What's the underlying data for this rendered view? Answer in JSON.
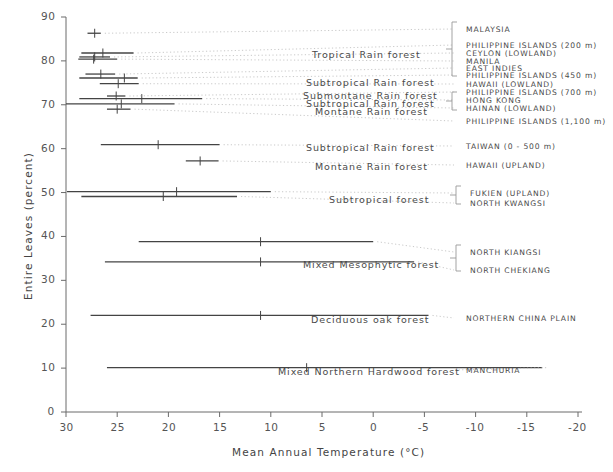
{
  "chart_data": {
    "type": "scatter",
    "title": "",
    "xlabel": "Mean Annual Temperature (°C)",
    "ylabel": "Entire Leaves (percent)",
    "xlim": [
      30,
      -20
    ],
    "ylim": [
      0,
      90
    ],
    "xticks": [
      30,
      25,
      20,
      15,
      10,
      5,
      0,
      -5,
      -10,
      -15,
      -20
    ],
    "xtick_labels": [
      "30",
      "25",
      "20",
      "15",
      "10",
      "5",
      "0",
      "-5",
      "-10",
      "-15",
      "-20"
    ],
    "yticks": [
      0,
      10,
      20,
      30,
      40,
      50,
      60,
      70,
      80,
      90
    ],
    "ytick_labels": [
      "0",
      "10",
      "20",
      "30",
      "40",
      "50",
      "60",
      "70",
      "80",
      "90"
    ],
    "grid": false,
    "legend_position": "right-annotations",
    "orientation": "horizontal-range-bars",
    "note": "Each row is a horizontal temperature-range bar with a central tick marking the mean annual temperature; y gives percent entire leaves.",
    "points": [
      {
        "site": "MALAYSIA",
        "forest": "Tropical Rain forest",
        "y": 86.3,
        "x_mean": 27.2,
        "x_low": 27.9,
        "x_high": 26.6
      },
      {
        "site": "PHILIPPINE ISLANDS (200 m)",
        "forest": "Tropical Rain forest",
        "y": 81.8,
        "x_mean": 26.4,
        "x_low": 28.5,
        "x_high": 23.4
      },
      {
        "site": "CEYLON (LOWLAND)",
        "forest": "Tropical Rain forest",
        "y": 80.9,
        "x_mean": 27.2,
        "x_low": 28.7,
        "x_high": 25.7
      },
      {
        "site": "MANILA",
        "forest": "Tropical Rain forest",
        "y": 80.4,
        "x_mean": 27.3,
        "x_low": 28.8,
        "x_high": 25.0
      },
      {
        "site": "EAST INDIES",
        "forest": "Tropical Rain forest",
        "y": 77.0,
        "x_mean": 26.6,
        "x_low": 28.1,
        "x_high": 25.2
      },
      {
        "site": "PHILIPPINE ISLANDS (450 m)",
        "forest": "Tropical Rain forest",
        "y": 76.1,
        "x_mean": 24.3,
        "x_low": 28.7,
        "x_high": 23.0
      },
      {
        "site": "HAWAII (LOWLAND)",
        "forest": "Subtropical Rain forest",
        "y": 74.8,
        "x_mean": 24.9,
        "x_low": 26.7,
        "x_high": 22.9
      },
      {
        "site": "PHILIPPINE ISLANDS (700 m)",
        "forest": "Submontane Rain forest",
        "y": 72.0,
        "x_mean": 25.1,
        "x_low": 26.0,
        "x_high": 24.2
      },
      {
        "site": "HONG KONG",
        "forest": "Subtropical Rain forest",
        "y": 71.4,
        "x_mean": 22.6,
        "x_low": 28.7,
        "x_high": 16.7
      },
      {
        "site": "HAINAN (LOWLAND)",
        "forest": "Subtropical Rain forest",
        "y": 70.2,
        "x_mean": 24.6,
        "x_low": 30.0,
        "x_high": 19.4
      },
      {
        "site": "PHILIPPINE ISLANDS (1,100 m)",
        "forest": "Montane Rain forest",
        "y": 69.0,
        "x_mean": 25.0,
        "x_low": 26.0,
        "x_high": 23.7
      },
      {
        "site": "TAIWAN (0 - 500 m)",
        "forest": "Subtropical Rain forest",
        "y": 60.9,
        "x_mean": 21.0,
        "x_low": 26.6,
        "x_high": 15.0
      },
      {
        "site": "HAWAII (UPLAND)",
        "forest": "Montane Rain forest",
        "y": 57.2,
        "x_mean": 16.9,
        "x_low": 18.3,
        "x_high": 15.1
      },
      {
        "site": "FUKIEN (UPLAND)",
        "forest": "Subtropical forest",
        "y": 50.2,
        "x_mean": 19.2,
        "x_low": 29.9,
        "x_high": 10.0
      },
      {
        "site": "NORTH KWANGSI",
        "forest": "Subtropical forest",
        "y": 49.1,
        "x_mean": 20.5,
        "x_low": 28.5,
        "x_high": 13.3
      },
      {
        "site": "NORTH KIANGSI",
        "forest": "Mixed Mesophytic forest",
        "y": 38.8,
        "x_mean": 11.0,
        "x_low": 22.9,
        "x_high": 0.0
      },
      {
        "site": "NORTH CHEKIANG",
        "forest": "Mixed Mesophytic forest",
        "y": 34.2,
        "x_mean": 11.0,
        "x_low": 26.2,
        "x_high": -4.0
      },
      {
        "site": "NORTHERN CHINA PLAIN",
        "forest": "Deciduous oak forest",
        "y": 22.0,
        "x_mean": 11.0,
        "x_low": 27.6,
        "x_high": -5.4
      },
      {
        "site": "MANCHURIA",
        "forest": "Mixed Northern Hardwood forest",
        "y": 10.1,
        "x_mean": 6.5,
        "x_low": 26.0,
        "x_high": -16.5
      }
    ],
    "forest_labels": [
      {
        "text": "Tropical Rain forest",
        "x_px": 312,
        "y_px": 49
      },
      {
        "text": "Subtropical Rain forest",
        "x_px": 306,
        "y_px": 77
      },
      {
        "text": "Submontane Rain forest",
        "x_px": 303,
        "y_px": 90
      },
      {
        "text": "Subtropical Rain forest",
        "x_px": 306,
        "y_px": 98
      },
      {
        "text": "Montane Rain forest",
        "x_px": 315,
        "y_px": 106
      },
      {
        "text": "Subtropical Rain forest",
        "x_px": 306,
        "y_px": 142
      },
      {
        "text": "Montane Rain forest",
        "x_px": 315,
        "y_px": 161
      },
      {
        "text": "Subtropical forest",
        "x_px": 329,
        "y_px": 194
      },
      {
        "text": "Mixed Mesophytic forest",
        "x_px": 303,
        "y_px": 259
      },
      {
        "text": "Deciduous oak forest",
        "x_px": 311,
        "y_px": 314
      },
      {
        "text": "Mixed Northern Hardwood forest",
        "x_px": 278,
        "y_px": 366
      }
    ],
    "site_labels": [
      {
        "text": "MALAYSIA",
        "x_px": 466,
        "y_px": 25
      },
      {
        "text": "PHILIPPINE ISLANDS (200 m)",
        "x_px": 466,
        "y_px": 41
      },
      {
        "text": "CEYLON (LOWLAND)",
        "x_px": 466,
        "y_px": 49
      },
      {
        "text": "MANILA",
        "x_px": 466,
        "y_px": 57
      },
      {
        "text": "EAST INDIES",
        "x_px": 466,
        "y_px": 64
      },
      {
        "text": "PHILIPPINE ISLANDS (450 m)",
        "x_px": 466,
        "y_px": 71
      },
      {
        "text": "HAWAII (LOWLAND)",
        "x_px": 466,
        "y_px": 80
      },
      {
        "text": "PHILIPPINE ISLANDS (700 m)",
        "x_px": 466,
        "y_px": 88
      },
      {
        "text": "HONG KONG",
        "x_px": 466,
        "y_px": 96
      },
      {
        "text": "HAINAN (LOWLAND)",
        "x_px": 466,
        "y_px": 104
      },
      {
        "text": "PHILIPPINE ISLANDS (1,100 m)",
        "x_px": 466,
        "y_px": 117
      },
      {
        "text": "TAIWAN (0 - 500 m)",
        "x_px": 466,
        "y_px": 142
      },
      {
        "text": "HAWAII (UPLAND)",
        "x_px": 466,
        "y_px": 161
      },
      {
        "text": "FUKIEN (UPLAND)",
        "x_px": 470,
        "y_px": 189
      },
      {
        "text": "NORTH KWANGSI",
        "x_px": 470,
        "y_px": 199
      },
      {
        "text": "NORTH KIANGSI",
        "x_px": 470,
        "y_px": 248
      },
      {
        "text": "NORTH CHEKIANG",
        "x_px": 470,
        "y_px": 266
      },
      {
        "text": "NORTHERN CHINA PLAIN",
        "x_px": 466,
        "y_px": 314
      },
      {
        "text": "MANCHURIA",
        "x_px": 466,
        "y_px": 366
      }
    ]
  },
  "axes": {
    "x_title": "Mean Annual Temperature (°C)",
    "y_title": "Entire Leaves (percent)"
  }
}
